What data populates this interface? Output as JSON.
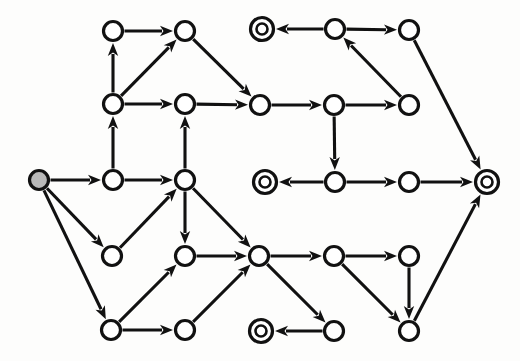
{
  "diagram": {
    "type": "directed-graph",
    "canvas": {
      "width": 520,
      "height": 361,
      "background": "#fdfdfc"
    },
    "style": {
      "stroke_color": "#111111",
      "node_fill": "#ffffff",
      "start_node_fill": "#b9b9b9",
      "node_radius": 9.5,
      "accept_outer_radius": 11.5,
      "accept_inner_radius": 5.5,
      "edge_width": 3.1,
      "arrow_length": 13,
      "arrow_half_width": 5.2
    },
    "legend": {
      "start_marker": "gray-filled circle",
      "accept_marker": "double circle",
      "normal_marker": "single circle",
      "edge_marker": "arrowhead"
    },
    "nodes": [
      {
        "id": "n0",
        "label": "",
        "x": 39,
        "y": 180,
        "kind": "start"
      },
      {
        "id": "n1",
        "label": "",
        "x": 113,
        "y": 31,
        "kind": "normal"
      },
      {
        "id": "n2",
        "label": "",
        "x": 185,
        "y": 31,
        "kind": "normal"
      },
      {
        "id": "n3",
        "label": "",
        "x": 262,
        "y": 29,
        "kind": "accept"
      },
      {
        "id": "n4",
        "label": "",
        "x": 335,
        "y": 29,
        "kind": "normal"
      },
      {
        "id": "n5",
        "label": "",
        "x": 409,
        "y": 30,
        "kind": "normal"
      },
      {
        "id": "n6",
        "label": "",
        "x": 113,
        "y": 104,
        "kind": "normal"
      },
      {
        "id": "n7",
        "label": "",
        "x": 185,
        "y": 104,
        "kind": "normal"
      },
      {
        "id": "n8",
        "label": "",
        "x": 260,
        "y": 105,
        "kind": "normal"
      },
      {
        "id": "n9",
        "label": "",
        "x": 334,
        "y": 105,
        "kind": "normal"
      },
      {
        "id": "n10",
        "label": "",
        "x": 409,
        "y": 105,
        "kind": "normal"
      },
      {
        "id": "n11",
        "label": "",
        "x": 113,
        "y": 180,
        "kind": "normal"
      },
      {
        "id": "n12",
        "label": "",
        "x": 185,
        "y": 180,
        "kind": "normal"
      },
      {
        "id": "n13",
        "label": "",
        "x": 265,
        "y": 182,
        "kind": "accept"
      },
      {
        "id": "n14",
        "label": "",
        "x": 335,
        "y": 182,
        "kind": "normal"
      },
      {
        "id": "n15",
        "label": "",
        "x": 409,
        "y": 182,
        "kind": "normal"
      },
      {
        "id": "n16",
        "label": "",
        "x": 487,
        "y": 182,
        "kind": "accept"
      },
      {
        "id": "n17",
        "label": "",
        "x": 112,
        "y": 256,
        "kind": "normal"
      },
      {
        "id": "n18",
        "label": "",
        "x": 185,
        "y": 256,
        "kind": "normal"
      },
      {
        "id": "n19",
        "label": "",
        "x": 259,
        "y": 256,
        "kind": "normal"
      },
      {
        "id": "n20",
        "label": "",
        "x": 334,
        "y": 256,
        "kind": "normal"
      },
      {
        "id": "n21",
        "label": "",
        "x": 409,
        "y": 256,
        "kind": "normal"
      },
      {
        "id": "n22",
        "label": "",
        "x": 111,
        "y": 330,
        "kind": "normal"
      },
      {
        "id": "n23",
        "label": "",
        "x": 185,
        "y": 330,
        "kind": "normal"
      },
      {
        "id": "n24",
        "label": "",
        "x": 261,
        "y": 331,
        "kind": "accept"
      },
      {
        "id": "n25",
        "label": "",
        "x": 334,
        "y": 331,
        "kind": "normal"
      },
      {
        "id": "n26",
        "label": "",
        "x": 409,
        "y": 331,
        "kind": "normal"
      }
    ],
    "edges": [
      {
        "from": "n1",
        "to": "n2",
        "label": ""
      },
      {
        "from": "n6",
        "to": "n1",
        "label": ""
      },
      {
        "from": "n6",
        "to": "n2",
        "label": ""
      },
      {
        "from": "n6",
        "to": "n7",
        "label": ""
      },
      {
        "from": "n2",
        "to": "n8",
        "label": ""
      },
      {
        "from": "n7",
        "to": "n8",
        "label": ""
      },
      {
        "from": "n8",
        "to": "n9",
        "label": ""
      },
      {
        "from": "n9",
        "to": "n10",
        "label": ""
      },
      {
        "from": "n9",
        "to": "n14",
        "label": ""
      },
      {
        "from": "n10",
        "to": "n4",
        "label": ""
      },
      {
        "from": "n4",
        "to": "n3",
        "label": ""
      },
      {
        "from": "n4",
        "to": "n5",
        "label": ""
      },
      {
        "from": "n5",
        "to": "n16",
        "label": ""
      },
      {
        "from": "n11",
        "to": "n6",
        "label": ""
      },
      {
        "from": "n12",
        "to": "n7",
        "label": ""
      },
      {
        "from": "n0",
        "to": "n11",
        "label": ""
      },
      {
        "from": "n0",
        "to": "n17",
        "label": ""
      },
      {
        "from": "n0",
        "to": "n22",
        "label": ""
      },
      {
        "from": "n11",
        "to": "n12",
        "label": ""
      },
      {
        "from": "n17",
        "to": "n12",
        "label": ""
      },
      {
        "from": "n12",
        "to": "n18",
        "label": ""
      },
      {
        "from": "n12",
        "to": "n19",
        "label": ""
      },
      {
        "from": "n14",
        "to": "n13",
        "label": ""
      },
      {
        "from": "n14",
        "to": "n15",
        "label": ""
      },
      {
        "from": "n15",
        "to": "n16",
        "label": ""
      },
      {
        "from": "n18",
        "to": "n19",
        "label": ""
      },
      {
        "from": "n22",
        "to": "n18",
        "label": ""
      },
      {
        "from": "n22",
        "to": "n23",
        "label": ""
      },
      {
        "from": "n23",
        "to": "n19",
        "label": ""
      },
      {
        "from": "n19",
        "to": "n20",
        "label": ""
      },
      {
        "from": "n19",
        "to": "n25",
        "label": ""
      },
      {
        "from": "n25",
        "to": "n24",
        "label": ""
      },
      {
        "from": "n20",
        "to": "n21",
        "label": ""
      },
      {
        "from": "n20",
        "to": "n26",
        "label": ""
      },
      {
        "from": "n21",
        "to": "n26",
        "label": ""
      },
      {
        "from": "n26",
        "to": "n16",
        "label": ""
      }
    ]
  }
}
